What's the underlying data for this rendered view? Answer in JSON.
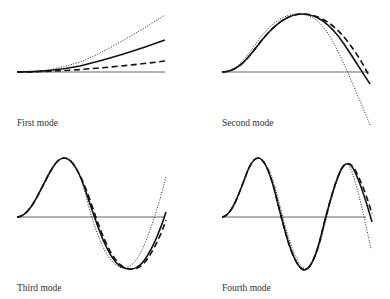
{
  "figure": {
    "panels": [
      {
        "id": "first",
        "label": "First mode"
      },
      {
        "id": "second",
        "label": "Second mode"
      },
      {
        "id": "third",
        "label": "Third mode"
      },
      {
        "id": "fourth",
        "label": "Fourth mode"
      }
    ],
    "line_styles": {
      "solid": "#111111",
      "dashed": "#111111",
      "dotted": "#222222",
      "baseline": "#555555"
    }
  }
}
